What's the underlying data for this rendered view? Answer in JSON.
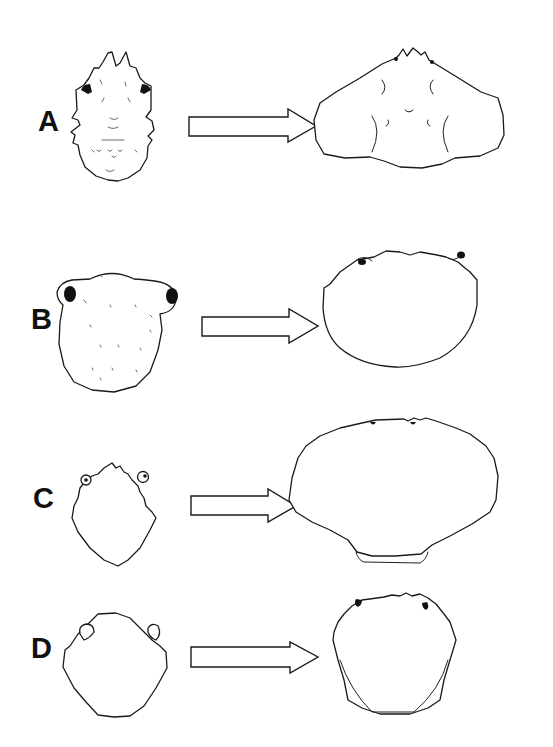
{
  "figure": {
    "rows": [
      {
        "label": "A",
        "left": "juvenile carapace with rostral spines and dorsal tubercles",
        "arrow": "right-arrow",
        "right": "adult triangular carapace with branchial grooves"
      },
      {
        "label": "B",
        "left": "rounded setose juvenile carapace with large dark eyes",
        "arrow": "right-arrow",
        "right": "adult oval carapace with small eyes"
      },
      {
        "label": "C",
        "left": "small toothed juvenile carapace with eyes",
        "arrow": "right-arrow",
        "right": "adult broad fan-shaped carapace with scalloped margin"
      },
      {
        "label": "D",
        "left": "juvenile carapace with pale eyes and lateral spines",
        "arrow": "right-arrow",
        "right": "adult spiny-margined carapace with dark eyes"
      }
    ],
    "colors": {
      "line": "#1a1a1a",
      "background": "#ffffff",
      "fill": "#ffffff",
      "eye": "#111111"
    }
  }
}
